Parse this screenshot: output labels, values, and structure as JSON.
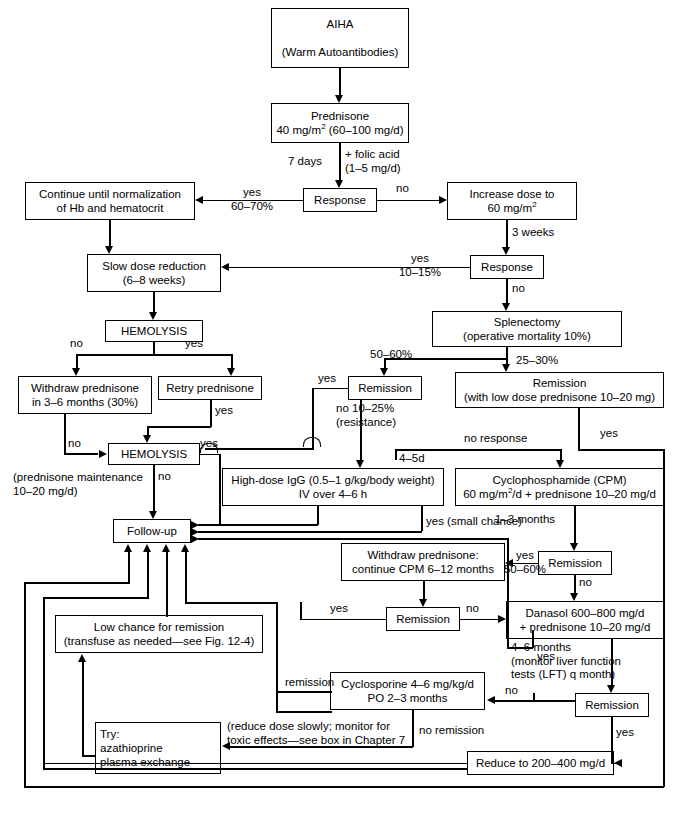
{
  "figure": {
    "type": "clinical-treatment-algorithm-flowchart"
  },
  "nodes": {
    "aiha": "AIHA\n\n(Warm Autoantibodies)",
    "prednisone": "Prednisone\n40 mg/m² (60–100 mg/d)",
    "response1": "Response",
    "continue_norm": "Continue until normalization\nof Hb and hematocrit",
    "increase_dose": "Increase dose to\n60 mg/m²",
    "slow_dose": "Slow dose reduction\n(6–8 weeks)",
    "response2": "Response",
    "hemolysis1": "HEMOLYSIS",
    "splenectomy": "Splenectomy\n(operative mortality 10%)",
    "withdraw_pred": "Withdraw prednisone\nin 3–6 months (30%)",
    "retry_pred": "Retry prednisone",
    "remission_spl": "Remission",
    "remission_lowdose": "Remission\n(with low dose prednisone 10–20 mg)",
    "hemolysis2": "HEMOLYSIS",
    "igg": "High-dose IgG (0.5–1 g/kg/body weight)\nIV over 4–6 h",
    "cpm": "Cyclophosphamide (CPM)\n60 mg/m²/d + prednisone 10–20 mg/d",
    "followup": "Follow-up",
    "withdraw_cpm": "Withdraw prednisone:\ncontinue CPM 6–12 months",
    "remission_cpm": "Remission",
    "remission_cpm2": "Remission",
    "danasol": "Danasol 600–800 mg/d\n+ prednisone 10–20 mg/d",
    "low_chance": "Low chance for remission\n(transfuse as needed—see Fig. 12-4)",
    "cyclosporine": "Cyclosporine 4–6 mg/kg/d\nPO 2–3 months",
    "remission_dan": "Remission",
    "try_box": "Try:\n     azathioprine\n     plasma  exchange",
    "reduce": "Reduce to 200–400 mg/d"
  },
  "edge_labels": {
    "seven_days": "7 days",
    "folic_acid": "+ folic acid\n(1–5 mg/d)",
    "yes_60_70": "yes\n60–70%",
    "no_r1": "no",
    "three_weeks": "3 weeks",
    "yes_10_15": "yes\n10–15%",
    "no_r2": "no",
    "no_hem1": "no",
    "yes_hem1": "yes",
    "yes_retry": "yes",
    "fifty_sixty": "50–60%",
    "twentyfive_thirty": "25–30%",
    "yes_rem_spl": "yes",
    "no_resistance": "no  10–25%\n       (resistance)",
    "no_response": "no response",
    "yes_rem_lowdose": "yes",
    "four_five_d": "4–5d",
    "no_withdraw": "no",
    "yes_hem2": "yes",
    "pred_maint": "(prednisone maintenance\n10–20 mg/d)",
    "no_hem2": "no",
    "yes_small_chance": "yes (small chance)",
    "one_three_months": "1–3 months",
    "yes_50_60_cpm": "yes\n50–60%",
    "no_cpm": "no",
    "yes_rem_cpm2": "yes",
    "no_rem_cpm2": "no",
    "four_six_months": "4–6 months\n(monitor liver function\ntests (LFT) q month)",
    "remission_cyclo": "remission",
    "no_danasol": "no",
    "yes_rem_dan": "yes",
    "reduce_note": "(reduce dose slowly; monitor for\ntoxic effects—see box in Chapter 7",
    "no_remission": "no remission"
  }
}
